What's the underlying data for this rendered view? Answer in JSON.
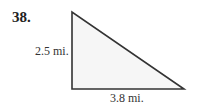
{
  "problem": {
    "number": "38.",
    "left_side_label": "2.5 mi.",
    "bottom_side_label": "3.8 mi."
  },
  "figure": {
    "shape": "right-triangle",
    "fill_color": "#f6f6f6",
    "stroke_color": "#333333"
  }
}
